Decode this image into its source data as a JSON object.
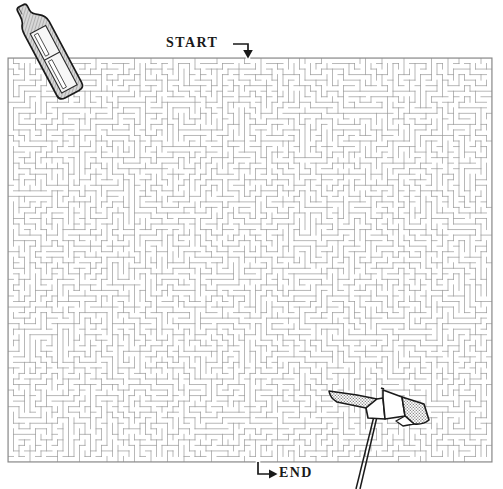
{
  "puzzle": {
    "type": "maze",
    "title": "Beach Maze Puzzle",
    "start": {
      "label": "START",
      "x": 248,
      "y": 58,
      "direction": "down"
    },
    "end": {
      "label": "END",
      "x": 258,
      "y": 462,
      "direction": "right"
    },
    "maze": {
      "x": 8,
      "y": 58,
      "width": 484,
      "height": 404,
      "cell_size": 5.5,
      "columns": 88,
      "rows": 73,
      "wall_color": "#9a9a9a",
      "border_color": "#8a8a8a",
      "background_color": "#ffffff",
      "wall_width": 0.7
    },
    "decorations": [
      {
        "name": "sunscreen-bottle",
        "position": {
          "x": 24,
          "y": 2,
          "width": 78,
          "height": 100
        },
        "rotation_deg": -28,
        "fill": "#c9c9c9",
        "label_fill": "#f4f4f4",
        "outline": "#1a1a1a"
      },
      {
        "name": "beach-umbrella",
        "position": {
          "x": 326,
          "y": 385,
          "width": 104,
          "height": 104
        },
        "canopy_panels": 5,
        "panel_fill_light": "#ffffff",
        "panel_fill_dark": "#b8b8b8",
        "pole_color": "#1a1a1a",
        "outline": "#1a1a1a"
      }
    ],
    "colors": {
      "ink": "#1a1a1a",
      "maze_wall": "#9a9a9a",
      "paper": "#ffffff",
      "shade": "#c9c9c9"
    }
  }
}
